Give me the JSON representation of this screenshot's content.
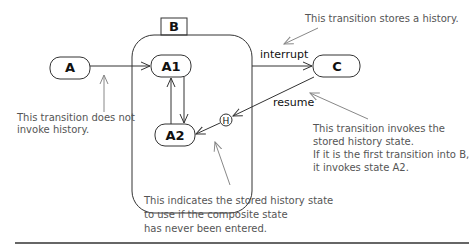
{
  "diagram": {
    "type": "UML state machine with shallow history",
    "states": {
      "A": "A",
      "B": "B",
      "A1": "A1",
      "A2": "A2",
      "C": "C",
      "history": "H"
    },
    "transitions": {
      "interrupt": "interrupt",
      "resume": "resume"
    },
    "notes": {
      "no_history": [
        "This transition does not",
        "invoke history."
      ],
      "stores_history": [
        "This transition stores a history."
      ],
      "invokes_history": [
        "This transition invokes the",
        "stored history state.",
        "If it is the first transition into B,",
        "it invokes state A2."
      ],
      "default_history": [
        "This indicates the stored history state",
        "to use if the composite state",
        "has never been entered."
      ]
    },
    "colors": {
      "line": "#333333",
      "note_text": "#555555",
      "note_arrow": "#888888"
    }
  }
}
